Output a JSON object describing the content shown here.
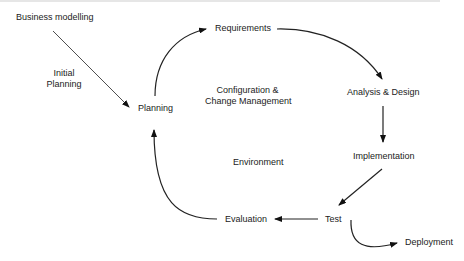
{
  "diagram": {
    "type": "process-cycle",
    "nodes": {
      "business_modelling": "Business modelling",
      "initial_planning_1": "Initial",
      "initial_planning_2": "Planning",
      "planning": "Planning",
      "requirements": "Requirements",
      "analysis_design": "Analysis & Design",
      "implementation": "Implementation",
      "test": "Test",
      "evaluation": "Evaluation",
      "deployment": "Deployment",
      "config_1": "Configuration &",
      "config_2": "Change Management",
      "environment": "Environment"
    },
    "edges": [
      {
        "from": "Business modelling",
        "to": "Planning",
        "label": "Initial Planning"
      },
      {
        "from": "Planning",
        "to": "Requirements"
      },
      {
        "from": "Requirements",
        "to": "Analysis & Design"
      },
      {
        "from": "Analysis & Design",
        "to": "Implementation"
      },
      {
        "from": "Implementation",
        "to": "Test"
      },
      {
        "from": "Test",
        "to": "Evaluation"
      },
      {
        "from": "Evaluation",
        "to": "Planning"
      },
      {
        "from": "Test",
        "to": "Deployment"
      }
    ]
  }
}
